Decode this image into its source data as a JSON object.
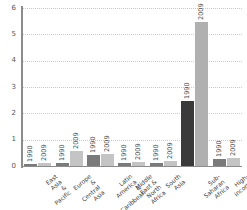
{
  "chart_data": {
    "type": "bar",
    "title": "",
    "subtitle": "",
    "xlabel": "",
    "ylabel": "",
    "ylim": [
      0,
      6
    ],
    "yticks": [
      0,
      1,
      2,
      3,
      4,
      5,
      6
    ],
    "ytick_labels": [
      "0",
      "1",
      "2",
      "3",
      "4",
      "5",
      "6"
    ],
    "grid": true,
    "legend": "none",
    "categories": [
      "East Asia &\nPacific",
      "Europe &\nCentral Asia",
      "Latin America &\nCaribbean",
      "Middle East &\nNorth Africa",
      "South Asia",
      "Sub-Saharan\nAfrica",
      "High-income"
    ],
    "series": [
      {
        "name": "1990",
        "color": "#7a7a7a",
        "values": [
          0.07,
          0.12,
          0.42,
          0.13,
          0.1,
          2.45,
          0.28
        ]
      },
      {
        "name": "2009",
        "color": "#c4c4c4",
        "values": [
          0.1,
          0.57,
          0.45,
          0.17,
          0.2,
          5.47,
          0.3
        ]
      }
    ],
    "bar_year_labels": [
      [
        "1990",
        "2009"
      ],
      [
        "1990",
        "2009"
      ],
      [
        "1990",
        "2009"
      ],
      [
        "1990",
        "2009"
      ],
      [
        "1990",
        "2009"
      ],
      [
        "1990",
        "2009"
      ],
      [
        "1990",
        "2009"
      ]
    ],
    "colors": {
      "series_1990": "#7a7a7a",
      "series_2009": "#c4c4c4",
      "highlight_1990": "#3a3a3a",
      "highlight_2009": "#b0b0b0",
      "axis": "#8c8c8c",
      "grid": "#c9c9c9",
      "background": "#ffffff"
    }
  }
}
